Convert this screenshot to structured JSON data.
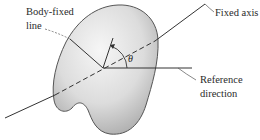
{
  "diagram": {
    "labels": {
      "body_fixed_line_1": "Body-fixed",
      "body_fixed_line_2": "line",
      "fixed_axis": "Fixed axis",
      "reference_direction_1": "Reference",
      "reference_direction_2": "direction",
      "angle": "θ"
    },
    "colors": {
      "body_fill_light": "#f2f2f2",
      "body_fill_dark": "#a8a8a8",
      "outline": "#555555",
      "line": "#333333"
    }
  }
}
